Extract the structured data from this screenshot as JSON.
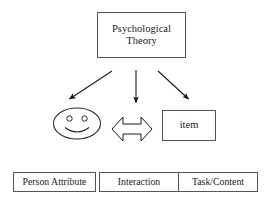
{
  "diagram": {
    "background_color": "#ffffff",
    "line_color": "#1a1a1a",
    "box_border_color": "#555555",
    "nodes": {
      "theory": {
        "label": "Psychological\nTheory",
        "shape": "rectangle"
      },
      "person": {
        "label": "",
        "shape": "smiley-face"
      },
      "item": {
        "label": "item",
        "shape": "rectangle"
      }
    },
    "legend_boxes": [
      {
        "label": "Person Attribute"
      },
      {
        "label": "Interaction"
      },
      {
        "label": "Task/Content"
      }
    ],
    "connectors": [
      {
        "name": "theory-to-person",
        "style": "solid-arrow",
        "direction": "down-left"
      },
      {
        "name": "theory-to-interaction",
        "style": "solid-arrow",
        "direction": "down"
      },
      {
        "name": "theory-to-item",
        "style": "solid-arrow",
        "direction": "down-right"
      },
      {
        "name": "person-item-interaction",
        "style": "hollow-double-arrow",
        "direction": "left-right"
      }
    ]
  }
}
